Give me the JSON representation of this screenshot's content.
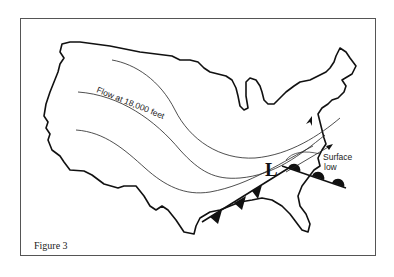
{
  "figure": {
    "caption": "Figure 3",
    "flow_label": "Flow at 18,000 feet",
    "low_symbol": "L",
    "surface_low_label_line1": "Surface",
    "surface_low_label_line2": "low"
  },
  "colors": {
    "outline": "#111111",
    "frame": "#555555",
    "background": "#ffffff"
  }
}
